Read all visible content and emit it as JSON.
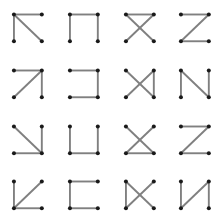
{
  "figure": {
    "title": "",
    "background_color": "#ffffff",
    "width": 223,
    "height": 214,
    "grid_rows": 4,
    "grid_cols": 4,
    "node_color": "#1a1a1a",
    "edge_color": "#808080",
    "node_radius": 3.6,
    "edge_width": 1.9
  },
  "chart_data": {
    "type": "diagram",
    "title": "",
    "xlabel": "",
    "ylabel": "",
    "node_positions": {
      "tl": [
        0.25,
        0.26
      ],
      "tr": [
        0.75,
        0.26
      ],
      "bl": [
        0.25,
        0.74
      ],
      "br": [
        0.75,
        0.74
      ]
    },
    "node_labels": [
      "tl",
      "tr",
      "bl",
      "br"
    ],
    "cells": [
      {
        "index": 0,
        "row": 0,
        "col": 0,
        "name": "cell-r0c0",
        "edges": [
          [
            "tl",
            "tr"
          ],
          [
            "tl",
            "bl"
          ],
          [
            "tl",
            "br"
          ]
        ]
      },
      {
        "index": 1,
        "row": 0,
        "col": 1,
        "name": "cell-r0c1",
        "edges": [
          [
            "tl",
            "tr"
          ],
          [
            "tl",
            "bl"
          ],
          [
            "tr",
            "br"
          ]
        ]
      },
      {
        "index": 2,
        "row": 0,
        "col": 2,
        "name": "cell-r0c2",
        "edges": [
          [
            "tl",
            "tr"
          ],
          [
            "tl",
            "br"
          ],
          [
            "tr",
            "bl"
          ]
        ]
      },
      {
        "index": 3,
        "row": 0,
        "col": 3,
        "name": "cell-r0c3",
        "edges": [
          [
            "tl",
            "tr"
          ],
          [
            "tr",
            "bl"
          ],
          [
            "bl",
            "br"
          ]
        ]
      },
      {
        "index": 4,
        "row": 1,
        "col": 0,
        "name": "cell-r1c0",
        "edges": [
          [
            "tl",
            "tr"
          ],
          [
            "tr",
            "bl"
          ],
          [
            "tr",
            "br"
          ]
        ]
      },
      {
        "index": 5,
        "row": 1,
        "col": 1,
        "name": "cell-r1c1",
        "edges": [
          [
            "tl",
            "tr"
          ],
          [
            "tr",
            "br"
          ],
          [
            "bl",
            "br"
          ]
        ]
      },
      {
        "index": 6,
        "row": 1,
        "col": 2,
        "name": "cell-r1c2",
        "edges": [
          [
            "tl",
            "br"
          ],
          [
            "tr",
            "bl"
          ],
          [
            "tr",
            "br"
          ]
        ]
      },
      {
        "index": 7,
        "row": 1,
        "col": 3,
        "name": "cell-r1c3",
        "edges": [
          [
            "tl",
            "bl"
          ],
          [
            "tl",
            "br"
          ],
          [
            "tr",
            "br"
          ]
        ]
      },
      {
        "index": 8,
        "row": 2,
        "col": 0,
        "name": "cell-r2c0",
        "edges": [
          [
            "tl",
            "br"
          ],
          [
            "tr",
            "br"
          ],
          [
            "bl",
            "br"
          ]
        ]
      },
      {
        "index": 9,
        "row": 2,
        "col": 1,
        "name": "cell-r2c1",
        "edges": [
          [
            "tl",
            "bl"
          ],
          [
            "bl",
            "br"
          ],
          [
            "tr",
            "br"
          ]
        ]
      },
      {
        "index": 10,
        "row": 2,
        "col": 2,
        "name": "cell-r2c2",
        "edges": [
          [
            "tl",
            "br"
          ],
          [
            "tr",
            "bl"
          ],
          [
            "bl",
            "br"
          ]
        ]
      },
      {
        "index": 11,
        "row": 2,
        "col": 3,
        "name": "cell-r2c3",
        "edges": [
          [
            "tl",
            "tr"
          ],
          [
            "tr",
            "bl"
          ],
          [
            "bl",
            "br"
          ]
        ]
      },
      {
        "index": 12,
        "row": 3,
        "col": 0,
        "name": "cell-r3c0",
        "edges": [
          [
            "tl",
            "bl"
          ],
          [
            "bl",
            "tr"
          ],
          [
            "bl",
            "br"
          ]
        ]
      },
      {
        "index": 13,
        "row": 3,
        "col": 1,
        "name": "cell-r3c1",
        "edges": [
          [
            "tl",
            "tr"
          ],
          [
            "tl",
            "bl"
          ],
          [
            "bl",
            "br"
          ]
        ]
      },
      {
        "index": 14,
        "row": 3,
        "col": 2,
        "name": "cell-r3c2",
        "edges": [
          [
            "tl",
            "bl"
          ],
          [
            "tl",
            "br"
          ],
          [
            "tr",
            "bl"
          ]
        ]
      },
      {
        "index": 15,
        "row": 3,
        "col": 3,
        "name": "cell-r3c3",
        "edges": [
          [
            "tl",
            "bl"
          ],
          [
            "tr",
            "bl"
          ],
          [
            "tr",
            "br"
          ]
        ]
      }
    ]
  }
}
